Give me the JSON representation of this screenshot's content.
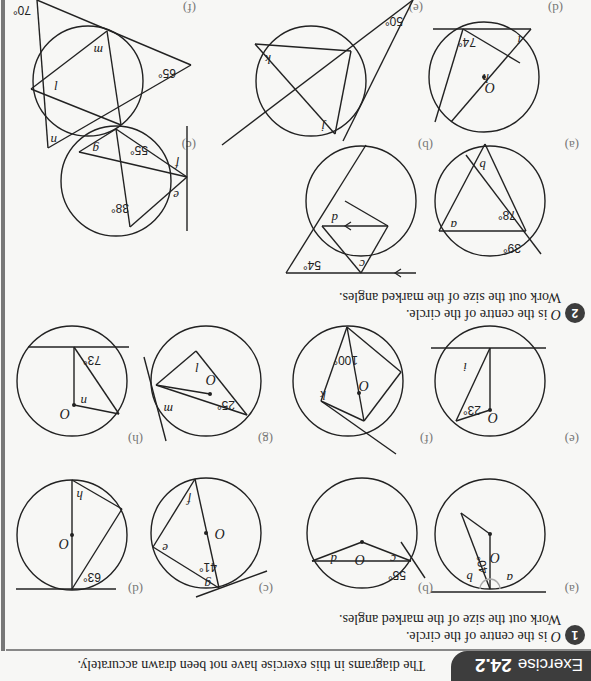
{
  "header": {
    "exercise_label": "Exercise",
    "exercise_number": "24.2",
    "intro": "The diagrams in this exercise have not been drawn accurately."
  },
  "question1": {
    "number": "1",
    "line1": "is the centre of the circle.",
    "centre": "O",
    "line2": "Work out the size of the marked angles.",
    "parts": [
      {
        "label": "(a)",
        "given": "40°",
        "unknowns": [
          "a",
          "b"
        ]
      },
      {
        "label": "(b)",
        "given": "55°",
        "unknowns": [
          "c",
          "d"
        ]
      },
      {
        "label": "(c)",
        "given": "41°",
        "unknowns": [
          "e",
          "f",
          "g"
        ]
      },
      {
        "label": "(d)",
        "given": "63°",
        "unknowns": [
          "h"
        ]
      },
      {
        "label": "(e)",
        "given": "23°",
        "unknowns": [
          "i"
        ]
      },
      {
        "label": "(f)",
        "given": "100°",
        "unknowns": [
          "k"
        ]
      },
      {
        "label": "(g)",
        "given": "25°",
        "unknowns": [
          "l",
          "m"
        ]
      },
      {
        "label": "(h)",
        "given": "73°",
        "unknowns": [
          "n"
        ]
      }
    ]
  },
  "question2": {
    "number": "2",
    "line1": "is the centre of the circle.",
    "centre": "O",
    "line2": "Work out the size of the marked angles.",
    "parts": [
      {
        "label": "(a)",
        "given": [
          "39°",
          "78°"
        ],
        "unknowns": [
          "a",
          "b"
        ]
      },
      {
        "label": "(b)",
        "given": [
          "54°"
        ],
        "unknowns": [
          "c",
          "d"
        ]
      },
      {
        "label": "(c)",
        "given": [
          "38°",
          "55°"
        ],
        "unknowns": [
          "e",
          "f",
          "g"
        ]
      },
      {
        "label": "(d)",
        "given": [
          "74°"
        ],
        "unknowns": [
          "h",
          "i"
        ]
      },
      {
        "label": "(e)",
        "given": [
          "50°"
        ],
        "unknowns": [
          "j",
          "k"
        ]
      },
      {
        "label": "(f)",
        "given": [
          "65°",
          "70°"
        ],
        "unknowns": [
          "l",
          "m",
          "n"
        ]
      }
    ]
  }
}
